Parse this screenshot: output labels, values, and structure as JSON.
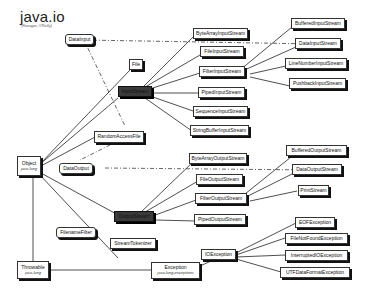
{
  "header": {
    "title": "java.io",
    "subtitle": "(Flanagan, O'Reilly)"
  },
  "nodes": {
    "object": {
      "label": "Object",
      "sub": "java.lang"
    },
    "throwable": {
      "label": "Throwable",
      "sub": "java.lang"
    },
    "exception": {
      "label": "Exception",
      "sub": "java.lang-exceptions"
    },
    "ioexception": {
      "label": "IOException"
    },
    "datainput": {
      "label": "DataInput"
    },
    "dataoutput": {
      "label": "DataOutput"
    },
    "file": {
      "label": "File"
    },
    "inputstream": {
      "label": "InputStream"
    },
    "outputstream": {
      "label": "OutputStream"
    },
    "randomaccessfile": {
      "label": "RandomAccessFile"
    },
    "filenamefilter": {
      "label": "FilenameFilter"
    },
    "streamtokenizer": {
      "label": "StreamTokenizer"
    },
    "bytearrayinputstream": {
      "label": "ByteArrayInputStream"
    },
    "fileinputstream": {
      "label": "FileInputStream"
    },
    "filterinputstream": {
      "label": "FilterInputStream"
    },
    "pipedinputstream": {
      "label": "PipedInputStream"
    },
    "sequenceinputstream": {
      "label": "SequenceInputStream"
    },
    "stringbufferinputstream": {
      "label": "StringBufferInputStream"
    },
    "bufferedinputstream": {
      "label": "BufferedInputStream"
    },
    "datainputstream": {
      "label": "DataInputStream"
    },
    "linenumberinputstream": {
      "label": "LineNumberInputStream"
    },
    "pushbackinputstream": {
      "label": "PushbackInputStream"
    },
    "bytearrayoutputstream": {
      "label": "ByteArrayOutputStream"
    },
    "fileoutputstream": {
      "label": "FileOutputStream"
    },
    "filteroutputstream": {
      "label": "FilterOutputStream"
    },
    "pipedoutputstream": {
      "label": "PipedOutputStream"
    },
    "bufferedoutputstream": {
      "label": "BufferedOutputStream"
    },
    "dataoutputstream": {
      "label": "DataOutputStream"
    },
    "printstream": {
      "label": "PrintStream"
    },
    "eofexception": {
      "label": "EOFException"
    },
    "filenotfoundexception": {
      "label": "FileNotFoundException"
    },
    "interruptedioexception": {
      "label": "InterruptedIOException"
    },
    "utfdataformatexception": {
      "label": "UTFDataFormatException"
    }
  },
  "legend": {
    "solid_line": "extends",
    "dashdot_line": "implements"
  },
  "colors": {
    "abstract_fill": "#3a3a3a",
    "node_fill": "#ffffff",
    "line": "#222222"
  }
}
